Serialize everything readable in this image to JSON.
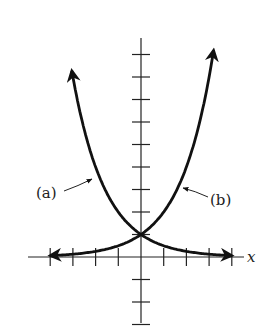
{
  "chart_data": {
    "type": "line",
    "title": "",
    "xlabel": "x",
    "ylabel": "",
    "axis_ranges": {
      "x": [
        -5,
        4.5
      ],
      "y": [
        -3,
        12
      ]
    },
    "grid": false,
    "ticks": {
      "x_unit": 1,
      "y_unit": 1,
      "labels_shown": false
    },
    "series": [
      {
        "name": "(a)",
        "function": "y = 2^(-x)",
        "x": [
          -3.5,
          -3,
          -2,
          -1,
          0,
          1,
          2,
          3,
          4
        ],
        "values": [
          11.3,
          8,
          4,
          2,
          1,
          0.5,
          0.25,
          0.125,
          0.0625
        ]
      },
      {
        "name": "(b)",
        "function": "y = 2^x",
        "x": [
          -4,
          -3,
          -2,
          -1,
          0,
          1,
          2,
          3,
          3.5
        ],
        "values": [
          0.0625,
          0.125,
          0.25,
          0.5,
          1,
          2,
          4,
          8,
          11.3
        ]
      }
    ],
    "annotations": [
      {
        "text": "(a)",
        "points_to": "left curve"
      },
      {
        "text": "(b)",
        "points_to": "right curve"
      }
    ]
  },
  "labels": {
    "a": "(a)",
    "b": "(b)",
    "x_axis": "x"
  },
  "colors": {
    "ink": "#111111",
    "background": "#ffffff"
  }
}
